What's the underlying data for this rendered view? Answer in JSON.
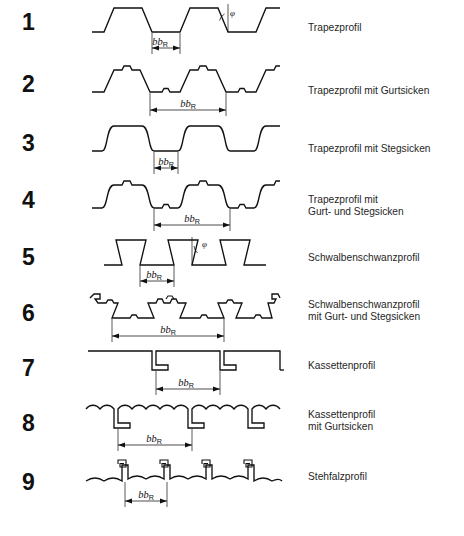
{
  "diagram": {
    "title_visible": false,
    "dimension_symbol": "b",
    "dimension_subscript": "R",
    "angle_symbol": "φ",
    "line_color": "#111111",
    "background_color": "#ffffff",
    "rows": [
      {
        "number": "1",
        "label_lines": [
          "Trapezprofil"
        ],
        "profile_type": "trapezoid",
        "has_angle_marker": true,
        "dimension": "b_R"
      },
      {
        "number": "2",
        "label_lines": [
          "Trapezprofil mit Gurtsicken"
        ],
        "profile_type": "trapezoid-flange-stiffeners",
        "has_angle_marker": false,
        "dimension": "b_R"
      },
      {
        "number": "3",
        "label_lines": [
          "Trapezprofil mit Stegsicken"
        ],
        "profile_type": "trapezoid-web-stiffeners",
        "has_angle_marker": false,
        "dimension": "b_R"
      },
      {
        "number": "4",
        "label_lines": [
          "Trapezprofil mit",
          "Gurt- und Stegsicken"
        ],
        "profile_type": "trapezoid-flange-and-web-stiffeners",
        "has_angle_marker": false,
        "dimension": "b_R"
      },
      {
        "number": "5",
        "label_lines": [
          "Schwalbenschwanzprofil"
        ],
        "profile_type": "dovetail",
        "has_angle_marker": true,
        "dimension": "b_R"
      },
      {
        "number": "6",
        "label_lines": [
          "Schwalbenschwanzprofil",
          "mit Gurt- und Stegsicken"
        ],
        "profile_type": "dovetail-flange-and-web-stiffeners",
        "has_angle_marker": false,
        "dimension": "b_R"
      },
      {
        "number": "7",
        "label_lines": [
          "Kassettenprofil"
        ],
        "profile_type": "cassette",
        "has_angle_marker": false,
        "dimension": "b_R"
      },
      {
        "number": "8",
        "label_lines": [
          "Kassettenprofil",
          "mit Gurtsicken"
        ],
        "profile_type": "cassette-flange-stiffeners",
        "has_angle_marker": false,
        "dimension": "b_R"
      },
      {
        "number": "9",
        "label_lines": [
          "Stehfalzprofil"
        ],
        "profile_type": "standing-seam",
        "has_angle_marker": false,
        "dimension": "b_R"
      }
    ]
  }
}
